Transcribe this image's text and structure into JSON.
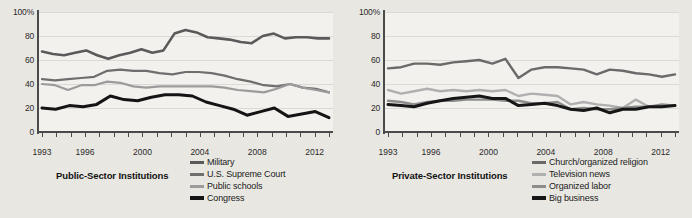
{
  "chart_data": [
    {
      "type": "line",
      "id": "public-sector",
      "title": "Public-Sector Institutions",
      "annotation": "Percentage saying “a great deal” or “quite a lot”",
      "xlabel": "",
      "ylabel": "",
      "ylim": [
        0,
        100
      ],
      "yticks": [
        0,
        20,
        40,
        60,
        80,
        100
      ],
      "ytick_labels": [
        "0",
        "20",
        "40",
        "60",
        "80",
        "100%"
      ],
      "grid": true,
      "legend_position": "bottom-right",
      "x": [
        1993,
        1994,
        1995,
        1996,
        1997,
        1998,
        1999,
        2000,
        2001,
        2002,
        2003,
        2004,
        2005,
        2006,
        2007,
        2008,
        2009,
        2010,
        2011,
        2012,
        2013
      ],
      "xtick_labels": [
        "1993",
        "1996",
        "2000",
        "2004",
        "2008",
        "2012"
      ],
      "xticks": [
        1993,
        1996,
        2000,
        2004,
        2008,
        2012
      ],
      "series": [
        {
          "name": "Military",
          "color": "#5a5a5a",
          "width": 2.6,
          "values": [
            67,
            65,
            64,
            66,
            68,
            64,
            61,
            64,
            66,
            69,
            66,
            68,
            82,
            85,
            83,
            79,
            78,
            77,
            75,
            74,
            80,
            82,
            78,
            79,
            79,
            78,
            78
          ]
        },
        {
          "name": "U.S. Supreme Court",
          "color": "#6e6e6e",
          "width": 2.2,
          "values": [
            44,
            43,
            44,
            45,
            46,
            51,
            52,
            51,
            51,
            49,
            48,
            50,
            50,
            49,
            47,
            44,
            42,
            39,
            38,
            40,
            37,
            36,
            33
          ]
        },
        {
          "name": "Public schools",
          "color": "#9b9b9b",
          "width": 2.2,
          "values": [
            40,
            39,
            35,
            39,
            39,
            42,
            41,
            38,
            37,
            38,
            38,
            38,
            38,
            38,
            37,
            35,
            34,
            33,
            36,
            40,
            37,
            35,
            33
          ]
        },
        {
          "name": "Congress",
          "color": "#141414",
          "width": 3.0,
          "values": [
            20,
            19,
            22,
            21,
            23,
            30,
            27,
            26,
            29,
            31,
            31,
            30,
            25,
            22,
            19,
            14,
            17,
            20,
            13,
            15,
            17,
            12
          ]
        }
      ]
    },
    {
      "type": "line",
      "id": "private-sector",
      "title": "Private-Sector Institutions",
      "annotation": "Percentage saying “a great deal” or “quite a lot”",
      "xlabel": "",
      "ylabel": "",
      "ylim": [
        0,
        100
      ],
      "yticks": [
        0,
        20,
        40,
        60,
        80,
        100
      ],
      "ytick_labels": [
        "0",
        "20",
        "40",
        "60",
        "80",
        "100%"
      ],
      "grid": true,
      "legend_position": "bottom-right",
      "x": [
        1993,
        1994,
        1995,
        1996,
        1997,
        1998,
        1999,
        2000,
        2001,
        2002,
        2003,
        2004,
        2005,
        2006,
        2007,
        2008,
        2009,
        2010,
        2011,
        2012,
        2013
      ],
      "xtick_labels": [
        "1993",
        "1996",
        "2000",
        "2004",
        "2008",
        "2012"
      ],
      "xticks": [
        1993,
        1996,
        2000,
        2004,
        2008,
        2012
      ],
      "series": [
        {
          "name": "Church/organized religion",
          "color": "#6a6a6a",
          "width": 2.4,
          "values": [
            53,
            54,
            57,
            57,
            56,
            58,
            59,
            60,
            57,
            61,
            45,
            52,
            54,
            54,
            53,
            52,
            48,
            52,
            51,
            49,
            48,
            46,
            48
          ]
        },
        {
          "name": "Television news",
          "color": "#b0b0b0",
          "width": 2.4,
          "values": [
            35,
            32,
            34,
            36,
            34,
            35,
            34,
            35,
            34,
            35,
            30,
            32,
            31,
            30,
            23,
            25,
            23,
            22,
            20,
            27,
            21,
            22,
            22
          ]
        },
        {
          "name": "Organized labor",
          "color": "#8d8d8d",
          "width": 2.4,
          "values": [
            26,
            25,
            23,
            25,
            26,
            26,
            27,
            27,
            27,
            26,
            26,
            24,
            24,
            25,
            19,
            20,
            19,
            19,
            20,
            21,
            21,
            23,
            22
          ]
        },
        {
          "name": "Big business",
          "color": "#161616",
          "width": 3.0,
          "values": [
            23,
            22,
            21,
            24,
            26,
            28,
            29,
            30,
            28,
            28,
            22,
            23,
            24,
            22,
            19,
            18,
            20,
            16,
            19,
            19,
            21,
            21,
            22
          ]
        }
      ]
    }
  ],
  "panels": [
    {
      "note": "Percentage saying “a great deal” or “quite a lot”",
      "sector_title": "Public-Sector Institutions",
      "ytick_labels": [
        "100%",
        "80",
        "60",
        "40",
        "20",
        "0"
      ],
      "xtick_labels": [
        "1993",
        "1996",
        "2000",
        "2004",
        "2008",
        "2012"
      ],
      "legend": [
        {
          "label": "Military",
          "color": "#5a5a5a"
        },
        {
          "label": "U.S. Supreme Court",
          "color": "#6e6e6e"
        },
        {
          "label": "Public schools",
          "color": "#9b9b9b"
        },
        {
          "label": "Congress",
          "color": "#141414"
        }
      ]
    },
    {
      "note": "Percentage saying “a great deal” or “quite a lot”",
      "sector_title": "Private-Sector Institutions",
      "ytick_labels": [
        "100%",
        "80",
        "60",
        "40",
        "20",
        "0"
      ],
      "xtick_labels": [
        "1993",
        "1996",
        "2000",
        "2004",
        "2008",
        "2012"
      ],
      "legend": [
        {
          "label": "Church/organized religion",
          "color": "#6a6a6a"
        },
        {
          "label": "Television news",
          "color": "#b0b0b0"
        },
        {
          "label": "Organized labor",
          "color": "#8d8d8d"
        },
        {
          "label": "Big business",
          "color": "#161616"
        }
      ]
    }
  ],
  "colors": {
    "page_background": "#e9e7e2",
    "plot_background": "#f2f1ed",
    "gridline": "#dcdad4",
    "axis": "#4a4a4a",
    "text": "#1b1b1b"
  }
}
